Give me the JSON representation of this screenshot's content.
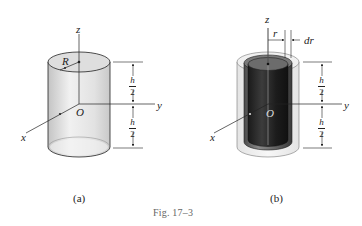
{
  "figure": {
    "caption": "Fig. 17–3",
    "colors": {
      "outline": "#222222",
      "cylinder_light": "#e6e6e6",
      "cylinder_shadow": "#bdbdbd",
      "inner_dark": "#2b2b2b",
      "inner_top": "#6a6a6a",
      "caption_gray": "#666666"
    }
  },
  "panel_a": {
    "label": "(a)",
    "axes": {
      "z": "z",
      "y": "y",
      "x": "x",
      "origin": "O"
    },
    "radius_label": "R",
    "dim_upper": {
      "num": "h",
      "den": "2"
    },
    "dim_lower": {
      "num": "h",
      "den": "2"
    }
  },
  "panel_b": {
    "label": "(b)",
    "axes": {
      "z": "z",
      "y": "y",
      "x": "x",
      "origin": "O"
    },
    "radius_label": "r",
    "shell_thickness_label": "dr",
    "dim_upper": {
      "num": "h",
      "den": "2"
    },
    "dim_lower": {
      "num": "h",
      "den": "2"
    }
  }
}
